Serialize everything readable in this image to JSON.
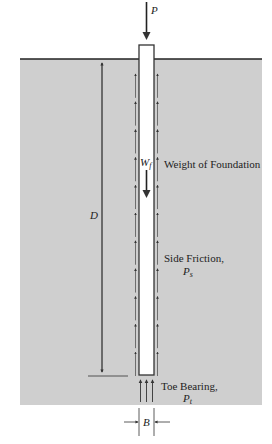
{
  "diagram": {
    "colors": {
      "soil": "#cfcfcf",
      "ground_line": "#222222",
      "pile_fill": "#ffffff",
      "pile_stroke": "#333333",
      "arrow": "#333333",
      "text": "#222222"
    },
    "labels": {
      "applied_load": "P",
      "weight_symbol": "W",
      "weight_sub": "f",
      "weight_text": "Weight of Foundation",
      "side_friction_text": "Side Friction,",
      "side_friction_symbol": "P",
      "side_friction_sub": "s",
      "toe_bearing_text": "Toe Bearing,",
      "toe_bearing_symbol": "P",
      "toe_bearing_sub": "t",
      "depth_symbol": "D",
      "width_symbol": "B"
    },
    "side_friction_arrow_count": 11,
    "toe_bearing_arrow_count": 3
  }
}
